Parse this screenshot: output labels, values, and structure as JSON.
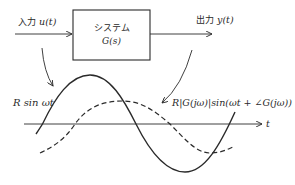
{
  "diagram": {
    "title": "",
    "input": {
      "label_jp": "入力",
      "label_var": "u(t)"
    },
    "system": {
      "line1": "システム",
      "line2": "G(s)"
    },
    "output": {
      "label_jp": "出力",
      "label_var": "y(t)"
    },
    "input_signal_label": "R sin ωt",
    "output_signal_label": "R|G(jω)|sin(ωt + ∠G(jω))",
    "time_axis_label": "t",
    "colors": {
      "stroke": "#2a2a2a",
      "background": "#ffffff"
    },
    "legend": [
      {
        "series": "input",
        "style": "solid",
        "label": "R sin ωt"
      },
      {
        "series": "output",
        "style": "dashed",
        "label": "R|G(jω)|sin(ωt + ∠G(jω))"
      }
    ]
  }
}
